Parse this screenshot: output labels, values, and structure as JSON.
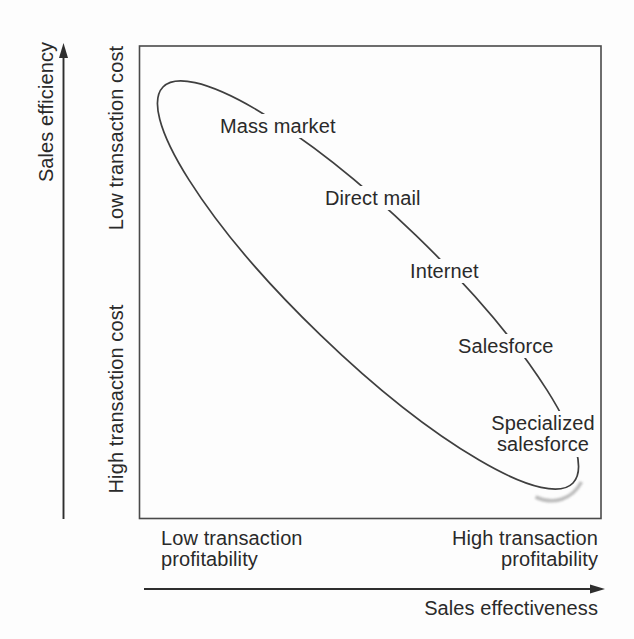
{
  "figure_type": "sales-channel-tradeoff-diagram",
  "colors": {
    "paper": "#fdfdfd",
    "ink": "#2a2a2a",
    "curve": "#3f3f3f",
    "border": "#4a4a4a",
    "shadow": "#b5b5b5"
  },
  "y_axis": {
    "title": "Sales efficiency",
    "top_region_label": "Low transaction cost",
    "bottom_region_label": "High transaction cost"
  },
  "x_axis": {
    "title": "Sales effectiveness",
    "left_region_label": "Low transaction profitability",
    "right_region_label": "High transaction profitability"
  },
  "channels": [
    {
      "label": "Mass market"
    },
    {
      "label": "Direct mail"
    },
    {
      "label": "Internet"
    },
    {
      "label": "Salesforce"
    },
    {
      "label": "Specialized salesforce"
    }
  ]
}
